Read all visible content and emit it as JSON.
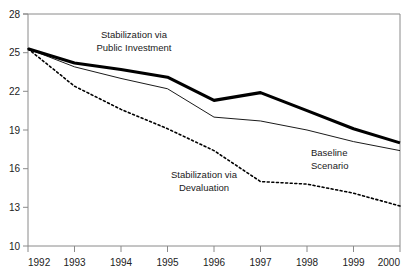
{
  "chart_data": {
    "type": "line",
    "title": "",
    "xlabel": "",
    "ylabel": "",
    "x": [
      1992,
      1993,
      1994,
      1995,
      1996,
      1997,
      1998,
      1999,
      2000
    ],
    "xlim": [
      1992,
      2000
    ],
    "ylim": [
      10,
      28
    ],
    "yticks": [
      10,
      13,
      16,
      19,
      22,
      25,
      28
    ],
    "xticks": [
      "1992",
      "1993",
      "1994",
      "1995",
      "1996",
      "1997",
      "1998",
      "1999",
      "2000"
    ],
    "grid": false,
    "legend": "inline-annotations",
    "series": [
      {
        "name": "Stabilization via Public Investment",
        "style": "thick-solid",
        "color": "#000000",
        "values": [
          25.3,
          24.2,
          23.7,
          23.1,
          21.3,
          21.9,
          20.5,
          19.1,
          18.0
        ]
      },
      {
        "name": "Baseline Scenario",
        "style": "thin-solid",
        "color": "#000000",
        "values": [
          25.3,
          23.9,
          23.0,
          22.2,
          20.0,
          19.7,
          19.0,
          18.1,
          17.4
        ]
      },
      {
        "name": "Stabilization via Devaluation",
        "style": "dotted",
        "color": "#000000",
        "values": [
          25.3,
          22.4,
          20.6,
          19.1,
          17.4,
          15.0,
          14.8,
          14.1,
          13.1
        ]
      }
    ],
    "annotations": [
      {
        "id": "public-investment",
        "line1": "Stabilization via",
        "line2": "Public Investment",
        "x": 134,
        "y": 38
      },
      {
        "id": "devaluation",
        "line1": "Stabilization via",
        "line2": "Devaluation",
        "x": 204,
        "y": 178
      },
      {
        "id": "baseline",
        "line1": "Baseline",
        "line2": "Scenario",
        "x": 311,
        "y": 156
      }
    ]
  },
  "axis": {
    "y_tick_labels": [
      "28",
      "25",
      "22",
      "19",
      "16",
      "13",
      "10"
    ],
    "x_tick_labels": [
      "1992",
      "1993",
      "1994",
      "1995",
      "1996",
      "1997",
      "1998",
      "1999",
      "2000"
    ]
  }
}
